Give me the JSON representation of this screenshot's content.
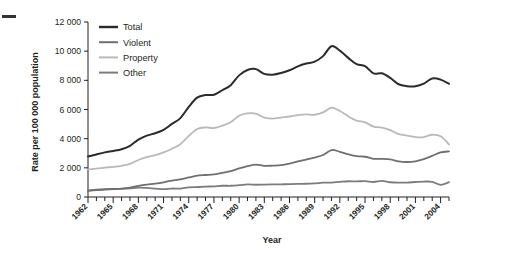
{
  "figure": {
    "top_marker": "dash-mark"
  },
  "chart_data": {
    "type": "line",
    "title": "",
    "xlabel": "Year",
    "ylabel": "Rate per 100 000 population",
    "xlim": [
      1962,
      2005
    ],
    "ylim": [
      0,
      12000
    ],
    "grid": false,
    "legend_position": "top-left",
    "y_ticks": [
      0,
      2000,
      4000,
      6000,
      8000,
      10000,
      12000
    ],
    "y_tick_labels": [
      "0",
      "2 000",
      "4 000",
      "6 000",
      "8 000",
      "10 000",
      "12 000"
    ],
    "x_tick_labels": [
      "1962",
      "1965",
      "1968",
      "1971",
      "1974",
      "1977",
      "1980",
      "1983",
      "1986",
      "1989",
      "1992",
      "1995",
      "1998",
      "2001",
      "2004"
    ],
    "x_tick_values": [
      1962,
      1965,
      1968,
      1971,
      1974,
      1977,
      1980,
      1983,
      1986,
      1989,
      1992,
      1995,
      1998,
      2001,
      2004
    ],
    "x": [
      1962,
      1963,
      1964,
      1965,
      1966,
      1967,
      1968,
      1969,
      1970,
      1971,
      1972,
      1973,
      1974,
      1975,
      1976,
      1977,
      1978,
      1979,
      1980,
      1981,
      1982,
      1983,
      1984,
      1985,
      1986,
      1987,
      1988,
      1989,
      1990,
      1991,
      1992,
      1993,
      1994,
      1995,
      1996,
      1997,
      1998,
      1999,
      2000,
      2001,
      2002,
      2003,
      2004,
      2005
    ],
    "series": [
      {
        "name": "Total",
        "color": "#2b2b2b",
        "width": 2.0,
        "values": [
          2771,
          2920,
          3060,
          3160,
          3280,
          3510,
          3940,
          4210,
          4370,
          4610,
          5010,
          5410,
          6180,
          6810,
          6990,
          7010,
          7320,
          7670,
          8340,
          8710,
          8770,
          8440,
          8390,
          8500,
          8690,
          8960,
          9150,
          9280,
          9660,
          10340,
          10040,
          9540,
          9110,
          8970,
          8480,
          8480,
          8170,
          7730,
          7600,
          7590,
          7770,
          8130,
          8050,
          7760
        ]
      },
      {
        "name": "Property",
        "color": "#b9b9b9",
        "width": 1.8,
        "values": [
          1891,
          1940,
          2010,
          2070,
          2140,
          2270,
          2540,
          2740,
          2870,
          3060,
          3310,
          3620,
          4180,
          4660,
          4770,
          4730,
          4890,
          5130,
          5570,
          5730,
          5710,
          5450,
          5380,
          5450,
          5520,
          5620,
          5670,
          5640,
          5800,
          6130,
          5900,
          5530,
          5240,
          5120,
          4830,
          4760,
          4580,
          4310,
          4210,
          4110,
          4110,
          4270,
          4160,
          3610
        ]
      },
      {
        "name": "Violent",
        "color": "#6f6f6f",
        "width": 1.8,
        "values": [
          430,
          470,
          510,
          540,
          580,
          650,
          760,
          850,
          920,
          1010,
          1120,
          1210,
          1340,
          1470,
          1510,
          1550,
          1660,
          1770,
          1960,
          2120,
          2220,
          2140,
          2150,
          2180,
          2290,
          2440,
          2570,
          2700,
          2880,
          3220,
          3100,
          2930,
          2800,
          2760,
          2620,
          2620,
          2580,
          2440,
          2400,
          2450,
          2600,
          2820,
          3060,
          3130
        ]
      },
      {
        "name": "Other",
        "color": "#7c7c7c",
        "width": 1.8,
        "values": [
          450,
          510,
          540,
          550,
          560,
          590,
          640,
          620,
          580,
          540,
          580,
          580,
          660,
          680,
          710,
          730,
          770,
          770,
          810,
          860,
          840,
          850,
          860,
          870,
          880,
          900,
          910,
          940,
          980,
          990,
          1040,
          1080,
          1070,
          1090,
          1030,
          1100,
          1010,
          980,
          990,
          1030,
          1060,
          1040,
          830,
          1020
        ]
      }
    ],
    "legend": [
      {
        "label": "Total",
        "color": "#2b2b2b"
      },
      {
        "label": "Violent",
        "color": "#6f6f6f"
      },
      {
        "label": "Property",
        "color": "#b9b9b9"
      },
      {
        "label": "Other",
        "color": "#7c7c7c"
      }
    ]
  }
}
